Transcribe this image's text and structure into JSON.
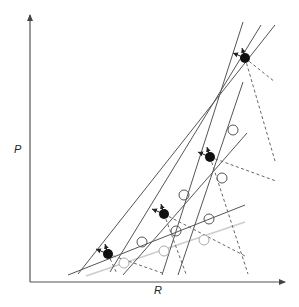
{
  "figure": {
    "type": "diagram",
    "x_axis_label": "R",
    "y_axis_label": "P",
    "colors": {
      "axis": "#555555",
      "solid_line": "#555555",
      "dashed_line": "#666666",
      "faint_line": "#cccccc",
      "filled_dot": "#111111",
      "hollow_circle": "#555555",
      "faint_circle": "#aaaaaa"
    }
  },
  "axes": {
    "origin": [
      30,
      282
    ],
    "y_top": [
      30,
      15
    ],
    "x_right": [
      285,
      282
    ]
  },
  "solid_lines": [
    {
      "x1": 68,
      "y1": 275,
      "x2": 245,
      "y2": 205
    },
    {
      "x1": 78,
      "y1": 274,
      "x2": 275,
      "y2": 25
    },
    {
      "x1": 110,
      "y1": 272,
      "x2": 261,
      "y2": 25
    },
    {
      "x1": 123,
      "y1": 275,
      "x2": 247,
      "y2": 133
    },
    {
      "x1": 162,
      "y1": 275,
      "x2": 243,
      "y2": 22
    },
    {
      "x1": 178,
      "y1": 275,
      "x2": 243,
      "y2": 82
    }
  ],
  "faint_lines": [
    {
      "x1": 86,
      "y1": 276,
      "x2": 245,
      "y2": 222
    }
  ],
  "dashed_lines": [
    {
      "x1": 108,
      "y1": 254,
      "x2": 117,
      "y2": 274
    },
    {
      "x1": 108,
      "y1": 254,
      "x2": 165,
      "y2": 274
    },
    {
      "x1": 164,
      "y1": 214,
      "x2": 186,
      "y2": 274
    },
    {
      "x1": 164,
      "y1": 214,
      "x2": 247,
      "y2": 257
    },
    {
      "x1": 210,
      "y1": 157,
      "x2": 248,
      "y2": 274
    },
    {
      "x1": 210,
      "y1": 157,
      "x2": 276,
      "y2": 181
    },
    {
      "x1": 245,
      "y1": 58,
      "x2": 275,
      "y2": 161
    },
    {
      "x1": 245,
      "y1": 58,
      "x2": 275,
      "y2": 82
    }
  ],
  "filled_dots": [
    {
      "cx": 108,
      "cy": 254,
      "r": 5
    },
    {
      "cx": 164,
      "cy": 214,
      "r": 5
    },
    {
      "cx": 210,
      "cy": 157,
      "r": 5
    },
    {
      "cx": 245,
      "cy": 58,
      "r": 5
    }
  ],
  "hollow_circles": [
    {
      "cx": 142,
      "cy": 242,
      "r": 5
    },
    {
      "cx": 176,
      "cy": 231,
      "r": 5
    },
    {
      "cx": 209,
      "cy": 219,
      "r": 5
    },
    {
      "cx": 184,
      "cy": 195,
      "r": 5
    },
    {
      "cx": 222,
      "cy": 178,
      "r": 5
    },
    {
      "cx": 233,
      "cy": 130,
      "r": 5
    }
  ],
  "faint_circles": [
    {
      "cx": 124,
      "cy": 263,
      "r": 5
    },
    {
      "cx": 164,
      "cy": 251,
      "r": 5
    },
    {
      "cx": 204,
      "cy": 240,
      "r": 5
    }
  ],
  "arrows_at_dots": [
    {
      "from": [
        108,
        254
      ],
      "to": [
        96,
        249
      ]
    },
    {
      "from": [
        108,
        254
      ],
      "to": [
        105,
        244
      ]
    },
    {
      "from": [
        164,
        214
      ],
      "to": [
        152,
        209
      ]
    },
    {
      "from": [
        164,
        214
      ],
      "to": [
        161,
        204
      ]
    },
    {
      "from": [
        210,
        157
      ],
      "to": [
        198,
        152
      ]
    },
    {
      "from": [
        210,
        157
      ],
      "to": [
        207,
        147
      ]
    },
    {
      "from": [
        245,
        58
      ],
      "to": [
        233,
        53
      ]
    },
    {
      "from": [
        245,
        58
      ],
      "to": [
        242,
        48
      ]
    }
  ]
}
